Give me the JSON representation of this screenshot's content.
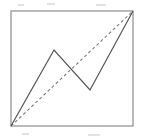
{
  "figure": {
    "background_color": "#ffffff",
    "canvas": {
      "width": 143,
      "height": 139
    },
    "frame": {
      "label": "square frame",
      "x": 11,
      "y": 11,
      "width": 122,
      "height": 115,
      "stroke_color": "#8c8c8c",
      "stroke_width": 1.2
    },
    "zigzag": {
      "label": "solid zigzag polyline",
      "stroke_color": "#555555",
      "stroke_width": 1.2,
      "style": "solid",
      "points": "11,126 54,50 90,90 133,11",
      "vertices": [
        {
          "name": "start-bottom-left",
          "x": 11,
          "y": 126
        },
        {
          "name": "peak",
          "x": 54,
          "y": 50
        },
        {
          "name": "valley",
          "x": 90,
          "y": 90
        },
        {
          "name": "end-top-right",
          "x": 133,
          "y": 11
        }
      ]
    },
    "chord": {
      "label": "dashed diagonal chord",
      "stroke_color": "#7a7a7a",
      "stroke_width": 1.1,
      "style": "dashed",
      "dash_pattern": "3 2.6",
      "x1": 11,
      "y1": 126,
      "x2": 133,
      "y2": 11
    },
    "crossings": [
      {
        "name": "chord-crosses-descending-segment",
        "x": 72,
        "y": 71
      }
    ],
    "artifacts": [
      {
        "name": "scan-speck-top-left",
        "x": 18,
        "y": 4,
        "width": 6,
        "height": 2
      },
      {
        "name": "scan-speck-top-mid",
        "x": 47,
        "y": 3,
        "width": 8,
        "height": 2
      },
      {
        "name": "scan-speck-top-right",
        "x": 96,
        "y": 4,
        "width": 10,
        "height": 2
      },
      {
        "name": "scan-speck-bottom-left",
        "x": 22,
        "y": 133,
        "width": 7,
        "height": 2
      },
      {
        "name": "scan-speck-bottom-right",
        "x": 88,
        "y": 134,
        "width": 12,
        "height": 2
      }
    ]
  }
}
